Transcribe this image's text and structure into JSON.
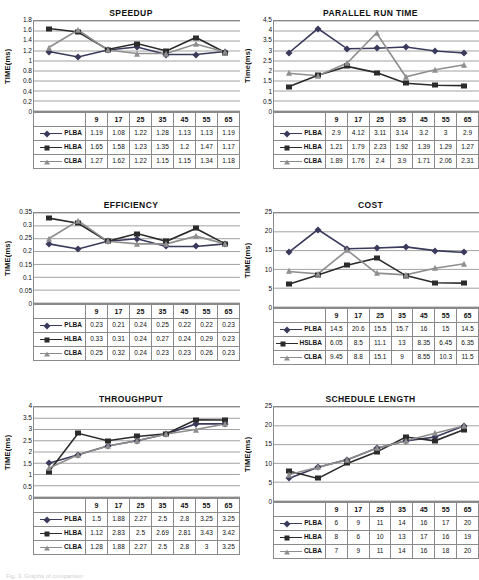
{
  "document": {
    "top_caption": "",
    "bottom_caption": "Fig. 3. Graphs of comparison"
  },
  "series_names": [
    "PLBA",
    "HLBA",
    "CLBA"
  ],
  "series_names_cost": [
    "PLBA",
    "HSLBA",
    "CLBA"
  ],
  "colors": {
    "plba": "#3a3a5c",
    "hlba": "#2b2b2b",
    "clba": "#8e8e8e",
    "grid": "#8a8a8a",
    "text": "#111111"
  },
  "charts": [
    {
      "id": "speedup",
      "title": "SPEEDUP",
      "ylabel": "TIME(ms)",
      "yticks": [
        "1.8",
        "1.6",
        "1.4",
        "1.2",
        "1",
        "0.8",
        "0.6",
        "0.4",
        "0.2",
        "0"
      ],
      "ymin": 0,
      "ymax": 1.8,
      "categories": [
        "9",
        "17",
        "25",
        "35",
        "45",
        "55",
        "65"
      ],
      "rows": [
        {
          "name": "PLBA",
          "marker": "diamond",
          "values": [
            "1.19",
            "1.08",
            "1.22",
            "1.28",
            "1.13",
            "1.13",
            "1.19"
          ],
          "nums": [
            1.19,
            1.08,
            1.22,
            1.28,
            1.13,
            1.13,
            1.19
          ]
        },
        {
          "name": "HLBA",
          "marker": "square",
          "values": [
            "1.65",
            "1.58",
            "1.23",
            "1.35",
            "1.2",
            "1.47",
            "1.17"
          ],
          "nums": [
            1.65,
            1.58,
            1.23,
            1.35,
            1.2,
            1.47,
            1.17
          ]
        },
        {
          "name": "CLBA",
          "marker": "tri",
          "values": [
            "1.27",
            "1.62",
            "1.22",
            "1.15",
            "1.15",
            "1.34",
            "1.18"
          ],
          "nums": [
            1.27,
            1.62,
            1.22,
            1.15,
            1.15,
            1.34,
            1.18
          ]
        }
      ]
    },
    {
      "id": "parallel-run-time",
      "title": "PARALLEL RUN TIME",
      "ylabel": "Time(ms)",
      "yticks": [
        "4.5",
        "4",
        "3.5",
        "3",
        "2.5",
        "2",
        "1.5",
        "1",
        "0.5",
        "0"
      ],
      "ymin": 0,
      "ymax": 4.5,
      "categories": [
        "9",
        "17",
        "25",
        "35",
        "45",
        "55",
        "65"
      ],
      "rows": [
        {
          "name": "PLBA",
          "marker": "diamond",
          "values": [
            "2.9",
            "4.12",
            "3.11",
            "3.14",
            "3.2",
            "3",
            "2.9"
          ],
          "nums": [
            2.9,
            4.12,
            3.11,
            3.14,
            3.2,
            3,
            2.9
          ]
        },
        {
          "name": "HLBA",
          "marker": "square",
          "values": [
            "1.21",
            "1.79",
            "2.23",
            "1.92",
            "1.39",
            "1.29",
            "1.27"
          ],
          "nums": [
            1.21,
            1.79,
            2.23,
            1.92,
            1.39,
            1.29,
            1.27
          ]
        },
        {
          "name": "CLBA",
          "marker": "tri",
          "values": [
            "1.89",
            "1.76",
            "2.4",
            "3.9",
            "1.71",
            "2.06",
            "2.31"
          ],
          "nums": [
            1.89,
            1.76,
            2.4,
            3.9,
            1.71,
            2.06,
            2.31
          ]
        }
      ]
    },
    {
      "id": "efficiency",
      "title": "EFFICIENCY",
      "ylabel": "TIME(ms)",
      "yticks": [
        "0.35",
        "0.3",
        "0.25",
        "0.2",
        "0.15",
        "0.1",
        "0.05",
        "0"
      ],
      "ymin": 0,
      "ymax": 0.35,
      "categories": [
        "9",
        "17",
        "25",
        "35",
        "45",
        "55",
        "65"
      ],
      "rows": [
        {
          "name": "PLBA",
          "marker": "diamond",
          "values": [
            "0.23",
            "0.21",
            "0.24",
            "0.25",
            "0.22",
            "0.22",
            "0.23"
          ],
          "nums": [
            0.23,
            0.21,
            0.24,
            0.25,
            0.22,
            0.22,
            0.23
          ]
        },
        {
          "name": "HLBA",
          "marker": "square",
          "values": [
            "0.33",
            "0.31",
            "0.24",
            "0.27",
            "0.24",
            "0.29",
            "0.23"
          ],
          "nums": [
            0.33,
            0.31,
            0.24,
            0.27,
            0.24,
            0.29,
            0.23
          ]
        },
        {
          "name": "CLBA",
          "marker": "tri",
          "values": [
            "0.25",
            "0.32",
            "0.24",
            "0.23",
            "0.23",
            "0.26",
            "0.23"
          ],
          "nums": [
            0.25,
            0.32,
            0.24,
            0.23,
            0.23,
            0.26,
            0.23
          ]
        }
      ]
    },
    {
      "id": "cost",
      "title": "COST",
      "ylabel": "TIME(ms)",
      "yticks": [
        "25",
        "20",
        "15",
        "10",
        "5",
        "0"
      ],
      "ymin": 0,
      "ymax": 25,
      "categories": [
        "9",
        "17",
        "25",
        "35",
        "45",
        "55",
        "65"
      ],
      "rows": [
        {
          "name": "PLBA",
          "marker": "diamond",
          "values": [
            "14.5",
            "20.6",
            "15.5",
            "15.7",
            "16",
            "15",
            "14.5"
          ],
          "nums": [
            14.5,
            20.6,
            15.5,
            15.7,
            16,
            15,
            14.5
          ]
        },
        {
          "name": "HSLBA",
          "marker": "square",
          "values": [
            "6.05",
            "8.5",
            "11.1",
            "13",
            "8.35",
            "6.45",
            "6.35"
          ],
          "nums": [
            6.05,
            8.5,
            11.1,
            13,
            8.35,
            6.45,
            6.35
          ]
        },
        {
          "name": "CLBA",
          "marker": "tri",
          "values": [
            "9.45",
            "8.8",
            "15.1",
            "9",
            "8.55",
            "10.3",
            "11.5"
          ],
          "nums": [
            9.45,
            8.8,
            15.1,
            9,
            8.55,
            10.3,
            11.5
          ]
        }
      ]
    },
    {
      "id": "throughput",
      "title": "THROUGHPUT",
      "ylabel": "TIME(ms)",
      "yticks": [
        "4",
        "3.5",
        "3",
        "2.5",
        "2",
        "1.5",
        "1",
        "0.5",
        "0"
      ],
      "ymin": 0,
      "ymax": 4,
      "categories": [
        "9",
        "17",
        "25",
        "35",
        "45",
        "55",
        "65"
      ],
      "rows": [
        {
          "name": "PLBA",
          "marker": "diamond",
          "values": [
            "1.5",
            "1.88",
            "2.27",
            "2.5",
            "2.8",
            "3.25",
            "3.25"
          ],
          "nums": [
            1.5,
            1.88,
            2.27,
            2.5,
            2.8,
            3.25,
            3.25
          ]
        },
        {
          "name": "HLBA",
          "marker": "square",
          "values": [
            "1.12",
            "2.83",
            "2.5",
            "2.69",
            "2.81",
            "3.43",
            "3.42"
          ],
          "nums": [
            1.12,
            2.83,
            2.5,
            2.69,
            2.81,
            3.43,
            3.42
          ]
        },
        {
          "name": "CLBA",
          "marker": "tri",
          "values": [
            "1.28",
            "1.88",
            "2.27",
            "2.5",
            "2.8",
            "3",
            "3.25"
          ],
          "nums": [
            1.28,
            1.88,
            2.27,
            2.5,
            2.8,
            3,
            3.25
          ]
        }
      ]
    },
    {
      "id": "schedule-length",
      "title": "SCHEDULE LENGTH",
      "ylabel": "TIME(ms)",
      "yticks": [
        "25",
        "20",
        "15",
        "10",
        "5",
        "0"
      ],
      "ymin": 0,
      "ymax": 25,
      "categories": [
        "9",
        "17",
        "25",
        "35",
        "45",
        "55",
        "65"
      ],
      "rows": [
        {
          "name": "PLBA",
          "marker": "diamond",
          "values": [
            "6",
            "9",
            "11",
            "14",
            "16",
            "17",
            "20"
          ],
          "nums": [
            6,
            9,
            11,
            14,
            16,
            17,
            20
          ]
        },
        {
          "name": "HLBA",
          "marker": "square",
          "values": [
            "8",
            "6",
            "10",
            "13",
            "17",
            "16",
            "19"
          ],
          "nums": [
            8,
            6,
            10,
            13,
            17,
            16,
            19
          ]
        },
        {
          "name": "CLBA",
          "marker": "tri",
          "values": [
            "7",
            "9",
            "11",
            "14",
            "16",
            "18",
            "20"
          ],
          "nums": [
            7,
            9,
            11,
            14,
            16,
            18,
            20
          ]
        }
      ]
    }
  ],
  "chart_data": [
    {
      "type": "line",
      "title": "SPEEDUP",
      "xlabel": "",
      "ylabel": "TIME(ms)",
      "categories": [
        "9",
        "17",
        "25",
        "35",
        "45",
        "55",
        "65"
      ],
      "ylim": [
        0,
        1.8
      ],
      "grid": true,
      "legend": "table-below",
      "series": [
        {
          "name": "PLBA",
          "values": [
            1.19,
            1.08,
            1.22,
            1.28,
            1.13,
            1.13,
            1.19
          ]
        },
        {
          "name": "HLBA",
          "values": [
            1.65,
            1.58,
            1.23,
            1.35,
            1.2,
            1.47,
            1.17
          ]
        },
        {
          "name": "CLBA",
          "values": [
            1.27,
            1.62,
            1.22,
            1.15,
            1.15,
            1.34,
            1.18
          ]
        }
      ]
    },
    {
      "type": "line",
      "title": "PARALLEL RUN TIME",
      "xlabel": "",
      "ylabel": "Time(ms)",
      "categories": [
        "9",
        "17",
        "25",
        "35",
        "45",
        "55",
        "65"
      ],
      "ylim": [
        0,
        4.5
      ],
      "grid": true,
      "legend": "table-below",
      "series": [
        {
          "name": "PLBA",
          "values": [
            2.9,
            4.12,
            3.11,
            3.14,
            3.2,
            3,
            2.9
          ]
        },
        {
          "name": "HLBA",
          "values": [
            1.21,
            1.79,
            2.23,
            1.92,
            1.39,
            1.29,
            1.27
          ]
        },
        {
          "name": "CLBA",
          "values": [
            1.89,
            1.76,
            2.4,
            3.9,
            1.71,
            2.06,
            2.31
          ]
        }
      ]
    },
    {
      "type": "line",
      "title": "EFFICIENCY",
      "xlabel": "",
      "ylabel": "TIME(ms)",
      "categories": [
        "9",
        "17",
        "25",
        "35",
        "45",
        "55",
        "65"
      ],
      "ylim": [
        0,
        0.35
      ],
      "grid": true,
      "legend": "table-below",
      "series": [
        {
          "name": "PLBA",
          "values": [
            0.23,
            0.21,
            0.24,
            0.25,
            0.22,
            0.22,
            0.23
          ]
        },
        {
          "name": "HLBA",
          "values": [
            0.33,
            0.31,
            0.24,
            0.27,
            0.24,
            0.29,
            0.23
          ]
        },
        {
          "name": "CLBA",
          "values": [
            0.25,
            0.32,
            0.24,
            0.23,
            0.23,
            0.26,
            0.23
          ]
        }
      ]
    },
    {
      "type": "line",
      "title": "COST",
      "xlabel": "",
      "ylabel": "TIME(ms)",
      "categories": [
        "9",
        "17",
        "25",
        "35",
        "45",
        "55",
        "65"
      ],
      "ylim": [
        0,
        25
      ],
      "grid": true,
      "legend": "table-below",
      "series": [
        {
          "name": "PLBA",
          "values": [
            14.5,
            20.6,
            15.5,
            15.7,
            16,
            15,
            14.5
          ]
        },
        {
          "name": "HSLBA",
          "values": [
            6.05,
            8.5,
            11.1,
            13,
            8.35,
            6.45,
            6.35
          ]
        },
        {
          "name": "CLBA",
          "values": [
            9.45,
            8.8,
            15.1,
            9,
            8.55,
            10.3,
            11.5
          ]
        }
      ]
    },
    {
      "type": "line",
      "title": "THROUGHPUT",
      "xlabel": "",
      "ylabel": "TIME(ms)",
      "categories": [
        "9",
        "17",
        "25",
        "35",
        "45",
        "55",
        "65"
      ],
      "ylim": [
        0,
        4
      ],
      "grid": true,
      "legend": "table-below",
      "series": [
        {
          "name": "PLBA",
          "values": [
            1.5,
            1.88,
            2.27,
            2.5,
            2.8,
            3.25,
            3.25
          ]
        },
        {
          "name": "HLBA",
          "values": [
            1.12,
            2.83,
            2.5,
            2.69,
            2.81,
            3.43,
            3.42
          ]
        },
        {
          "name": "CLBA",
          "values": [
            1.28,
            1.88,
            2.27,
            2.5,
            2.8,
            3,
            3.25
          ]
        }
      ]
    },
    {
      "type": "line",
      "title": "SCHEDULE LENGTH",
      "xlabel": "",
      "ylabel": "TIME(ms)",
      "categories": [
        "9",
        "17",
        "25",
        "35",
        "45",
        "55",
        "65"
      ],
      "ylim": [
        0,
        25
      ],
      "grid": true,
      "legend": "table-below",
      "series": [
        {
          "name": "PLBA",
          "values": [
            6,
            9,
            11,
            14,
            16,
            17,
            20
          ]
        },
        {
          "name": "HLBA",
          "values": [
            8,
            6,
            10,
            13,
            17,
            16,
            19
          ]
        },
        {
          "name": "CLBA",
          "values": [
            7,
            9,
            11,
            14,
            16,
            18,
            20
          ]
        }
      ]
    }
  ]
}
